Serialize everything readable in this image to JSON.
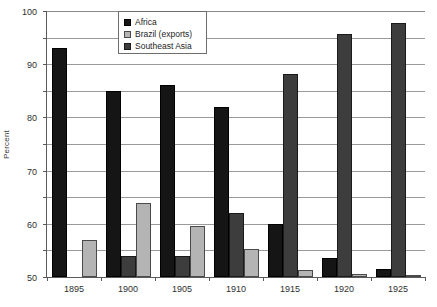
{
  "chart_data": {
    "type": "bar",
    "title": "",
    "xlabel": "",
    "ylabel": "Percent",
    "ylim": [
      0,
      100
    ],
    "ytick_step": 10,
    "yticks": [
      0,
      10,
      20,
      30,
      40,
      50,
      60,
      70,
      80,
      90,
      100
    ],
    "ytick_labels": [
      "0",
      "10",
      "20",
      "30",
      "40",
      "50",
      "60",
      "70",
      "80",
      "90",
      "100"
    ],
    "categories": [
      "1895",
      "1900",
      "1905",
      "1910",
      "1915",
      "1920",
      "1925"
    ],
    "grid": "horizontal",
    "legend_position": "top-center",
    "legend_order": [
      "Africa",
      "Brazil (exports)",
      "Southeast Asia"
    ],
    "bar_order_in_group": [
      "Africa",
      "Southeast Asia",
      "Brazil (exports)"
    ],
    "series": [
      {
        "name": "Africa",
        "color": "#151515",
        "values": [
          86,
          69.8,
          72,
          64,
          20,
          7,
          3
        ]
      },
      {
        "name": "Southeast Asia",
        "color": "#3d3d3d",
        "values": [
          0,
          8,
          8,
          24,
          76.5,
          91.5,
          95.5
        ]
      },
      {
        "name": "Brazil (exports)",
        "color": "#b4b4b4",
        "values": [
          14,
          27.8,
          19,
          10.5,
          2.5,
          1,
          0.5
        ]
      }
    ]
  },
  "legend": {
    "entries": [
      {
        "label": "Africa",
        "swatch": "s-africa"
      },
      {
        "label": "Brazil (exports)",
        "swatch": "s-brazil"
      },
      {
        "label": "Southeast Asia",
        "swatch": "s-sea"
      }
    ]
  }
}
